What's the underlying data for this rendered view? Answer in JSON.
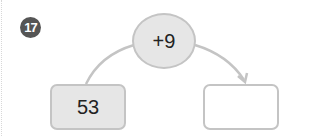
{
  "problem": {
    "number": "17",
    "start_value": "53",
    "operation": "+9",
    "answer_value": ""
  },
  "colors": {
    "badge": "#555555",
    "shape_fill": "#e6e6e6",
    "shape_border": "#c4c4c4"
  }
}
